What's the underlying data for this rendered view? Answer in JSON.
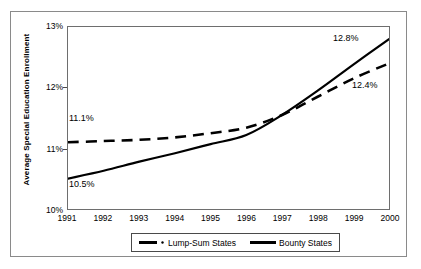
{
  "chart_data": {
    "type": "line",
    "title": "",
    "xlabel": "",
    "ylabel": "Average Special Education Enrollment",
    "x": [
      1991,
      1992,
      1993,
      1994,
      1995,
      1996,
      1997,
      1998,
      1999,
      2000
    ],
    "xtick_labels": [
      "1991",
      "1992",
      "1993",
      "1994",
      "1995",
      "1996",
      "1997",
      "1998",
      "1999",
      "2000"
    ],
    "ytick_labels": [
      "10%",
      "11%",
      "12%",
      "13%"
    ],
    "ytick_values": [
      10,
      11,
      12,
      13
    ],
    "ylim": [
      10,
      13
    ],
    "xlim": [
      1991,
      2000
    ],
    "grid": false,
    "legend_position": "bottom",
    "series": [
      {
        "name": "Lump-Sum States",
        "style": "dashed",
        "color": "#000000",
        "values": [
          11.1,
          11.12,
          11.14,
          11.18,
          11.25,
          11.34,
          11.55,
          11.85,
          12.15,
          12.4
        ]
      },
      {
        "name": "Bounty States",
        "style": "solid",
        "color": "#000000",
        "values": [
          10.5,
          10.63,
          10.78,
          10.92,
          11.07,
          11.22,
          11.55,
          11.95,
          12.38,
          12.8
        ]
      }
    ],
    "annotations": [
      {
        "text": "11.1%",
        "series": "Lump-Sum States",
        "x": 1991,
        "y": 11.1
      },
      {
        "text": "10.5%",
        "series": "Bounty States",
        "x": 1991,
        "y": 10.5
      },
      {
        "text": "12.8%",
        "series": "Bounty States",
        "x": 2000,
        "y": 12.8
      },
      {
        "text": "12.4%",
        "series": "Lump-Sum States",
        "x": 2000,
        "y": 12.4
      }
    ]
  },
  "legend": {
    "items": [
      {
        "label": "Lump-Sum States",
        "marker": "dashed-line-with-dot"
      },
      {
        "label": "Bounty States",
        "marker": "solid-line"
      }
    ]
  }
}
